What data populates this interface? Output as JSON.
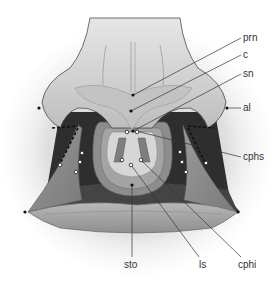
{
  "diagram": {
    "labels": {
      "prn": "prn",
      "c": "c",
      "sn": "sn",
      "al": "al",
      "cphs": "cphs",
      "sto": "sto",
      "ls": "ls",
      "cphi": "cphi"
    },
    "colors": {
      "background": "#ffffff",
      "skin_light": "#d4d4d4",
      "skin_mid": "#b5b5b5",
      "skin_dark": "#8a8a8a",
      "cavity": "#2a2a2a",
      "lip": "#a8a8a8",
      "leader_line": "#333333",
      "marker": "#111111"
    }
  }
}
